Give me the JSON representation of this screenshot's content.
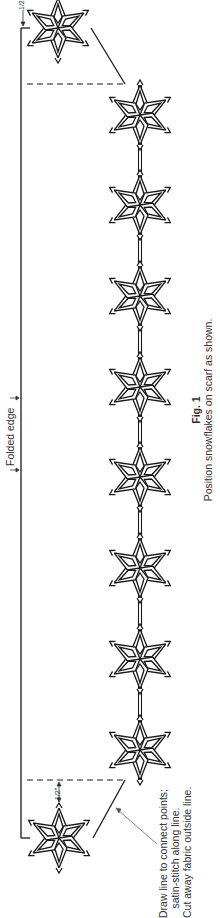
{
  "figure": {
    "label": "Fig. 1",
    "caption": "Position snowflakes on scarf as shown."
  },
  "annotations": {
    "folded_edge": "Folded edge",
    "half_inch_top": "1/2\"",
    "half_inch_bottom": "1/2\"",
    "instructions": [
      "Draw line to connect points;",
      "satin-stitch along line.",
      "Cut away fabric outside line."
    ]
  },
  "layout": {
    "spine_x": 140,
    "spine_top": 84,
    "spine_bottom": 780,
    "frame_x": 21,
    "frame_top": 28,
    "frame_bottom": 838,
    "spine_snowflakes_y": [
      115,
      205,
      296,
      387,
      477,
      568,
      659,
      750
    ],
    "corner_snowflakes": [
      {
        "x": 58,
        "y": 28
      },
      {
        "x": 59,
        "y": 838
      }
    ],
    "colors": {
      "line": "#1a1a1a",
      "background": "#ffffff"
    }
  }
}
